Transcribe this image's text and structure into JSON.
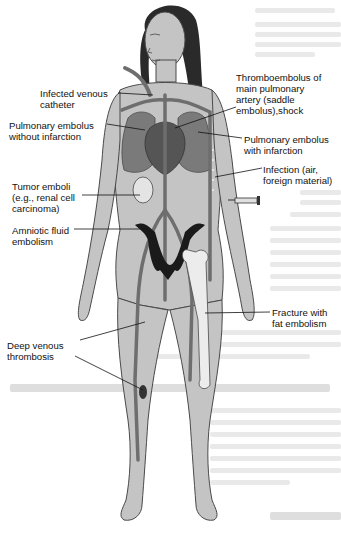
{
  "figure": {
    "colors": {
      "skin": "#c4c4c4",
      "skin_outline": "#4a4a4a",
      "hair": "#2a2a2a",
      "vessel": "#6e6e6e",
      "organ_dark": "#555555",
      "uterus": "#1a1a1a",
      "bone": "#ececec",
      "bleed_text": "#e4e4e4"
    },
    "labels": [
      {
        "id": "infected-venous-catheter",
        "text": "Infected venous\ncatheter",
        "x": 40,
        "y": 88
      },
      {
        "id": "thromboembolus-saddle",
        "text": "Thromboembolus of\nmain pulmonary\nartery (saddle\nembolus),shock",
        "x": 236,
        "y": 72
      },
      {
        "id": "pe-without-infarction",
        "text": "Pulmonary embolus\nwithout infarction",
        "x": 9,
        "y": 120
      },
      {
        "id": "pe-with-infarction",
        "text": "Pulmonary embolus\nwith infarction",
        "x": 244,
        "y": 134
      },
      {
        "id": "infection-air",
        "text": "Infection (air,\nforeign material)",
        "x": 263,
        "y": 164
      },
      {
        "id": "tumor-emboli",
        "text": "Tumor emboli\n(e.g., renal cell\ncarcinoma)",
        "x": 12,
        "y": 181
      },
      {
        "id": "amniotic-fluid-embolism",
        "text": "Amniotic fluid\nembolism",
        "x": 12,
        "y": 225
      },
      {
        "id": "fracture-fat-embolism",
        "text": "Fracture with\nfat embolism",
        "x": 272,
        "y": 307
      },
      {
        "id": "deep-venous-thrombosis",
        "text": "Deep venous\nthrombosis",
        "x": 7,
        "y": 340
      }
    ]
  }
}
